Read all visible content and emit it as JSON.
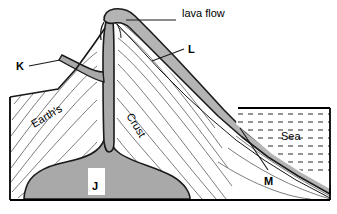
{
  "diagram": {
    "colors": {
      "outline": "#1a1a1a",
      "magma_fill": "#a9a9a9",
      "lava_fill": "#b4b4b4",
      "strata_line": "#555555",
      "sea_dash": "#333333",
      "background": "#ffffff",
      "frame": "#000000"
    },
    "labels": {
      "lava_flow": "lava flow",
      "k": "K",
      "l": "L",
      "m": "M",
      "j": "J",
      "earths": "Earth's",
      "crust": "Crust",
      "sea": "Sea"
    }
  }
}
